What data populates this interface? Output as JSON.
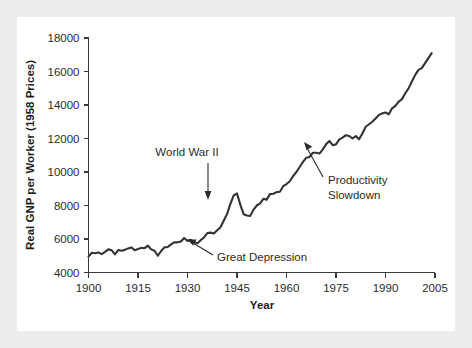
{
  "figure": {
    "background_color": "#ececec",
    "card_color": "#ffffff",
    "line_color": "#333333",
    "text_color": "#2b2b2b"
  },
  "chart_data": {
    "type": "line",
    "title": "",
    "subtitle": "",
    "xlabel": "Year",
    "ylabel": "Real GNP per Worker (1958 Prices)",
    "xlim": [
      1900,
      2005
    ],
    "ylim": [
      4000,
      18000
    ],
    "xticks": [
      1900,
      1915,
      1930,
      1945,
      1960,
      1975,
      1990,
      2005
    ],
    "yticks": [
      4000,
      6000,
      8000,
      10000,
      12000,
      14000,
      16000,
      18000
    ],
    "xtick_labels": [
      "1900",
      "1915",
      "1930",
      "1945",
      "1960",
      "1975",
      "1990",
      "2005"
    ],
    "ytick_labels": [
      "4000",
      "6000",
      "8000",
      "10000",
      "12000",
      "14000",
      "16000",
      "18000"
    ],
    "grid": false,
    "legend": null,
    "series": [
      {
        "name": "Real GNP per Worker",
        "x": [
          1900,
          1901,
          1902,
          1903,
          1904,
          1905,
          1906,
          1907,
          1908,
          1909,
          1910,
          1911,
          1912,
          1913,
          1914,
          1915,
          1916,
          1917,
          1918,
          1919,
          1920,
          1921,
          1922,
          1923,
          1924,
          1925,
          1926,
          1927,
          1928,
          1929,
          1930,
          1931,
          1932,
          1933,
          1934,
          1935,
          1936,
          1937,
          1938,
          1939,
          1940,
          1941,
          1942,
          1943,
          1944,
          1945,
          1946,
          1947,
          1948,
          1949,
          1950,
          1951,
          1952,
          1953,
          1954,
          1955,
          1956,
          1957,
          1958,
          1959,
          1960,
          1961,
          1962,
          1963,
          1964,
          1965,
          1966,
          1967,
          1968,
          1969,
          1970,
          1971,
          1972,
          1973,
          1974,
          1975,
          1976,
          1977,
          1978,
          1979,
          1980,
          1981,
          1982,
          1983,
          1984,
          1985,
          1986,
          1987,
          1988,
          1989,
          1990,
          1991,
          1992,
          1993,
          1994,
          1995,
          1996,
          1997,
          1998,
          1999,
          2000,
          2001,
          2002,
          2003,
          2004
        ],
        "values": [
          4950,
          5180,
          5150,
          5200,
          5100,
          5230,
          5380,
          5330,
          5080,
          5340,
          5300,
          5350,
          5440,
          5500,
          5330,
          5400,
          5470,
          5450,
          5600,
          5380,
          5300,
          5000,
          5280,
          5500,
          5520,
          5680,
          5800,
          5800,
          5850,
          6060,
          5880,
          5950,
          5830,
          5740,
          5930,
          6090,
          6350,
          6380,
          6330,
          6520,
          6700,
          7100,
          7500,
          8100,
          8600,
          8720,
          8050,
          7480,
          7400,
          7380,
          7750,
          8000,
          8130,
          8400,
          8350,
          8680,
          8700,
          8800,
          8820,
          9150,
          9280,
          9450,
          9750,
          10000,
          10300,
          10600,
          10850,
          10900,
          11150,
          11150,
          11100,
          11350,
          11650,
          11850,
          11600,
          11650,
          11950,
          12050,
          12200,
          12150,
          12000,
          12150,
          11950,
          12300,
          12700,
          12850,
          13000,
          13200,
          13400,
          13500,
          13550,
          13450,
          13800,
          13950,
          14200,
          14350,
          14700,
          15000,
          15400,
          15800,
          16100,
          16200,
          16500,
          16800,
          17100
        ]
      }
    ],
    "annotations": [
      {
        "label": "World War II",
        "target_year": 1945,
        "target_value": 8720,
        "arrow": "down"
      },
      {
        "label": "Great Depression",
        "target_year": 1933,
        "target_value": 5740,
        "arrow": "up-left"
      },
      {
        "label_line_1": "Productivity",
        "label_line_2": "Slowdown",
        "target_year": 1973,
        "target_value": 11850,
        "arrow": "up-left"
      }
    ]
  }
}
